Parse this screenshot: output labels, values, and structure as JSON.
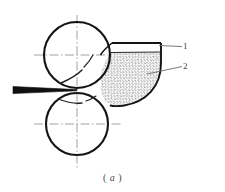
{
  "figure": {
    "caption": "( a )",
    "caption_prefix": "(",
    "caption_item": "a",
    "caption_suffix": ")",
    "labels": [
      {
        "id": "1",
        "text": "1",
        "refers_to": "hopper-wall"
      },
      {
        "id": "2",
        "text": "2",
        "refers_to": "powder-material"
      }
    ],
    "colors": {
      "line": "#1a1a1a",
      "centerline": "#808080",
      "stipple": "#555555",
      "leader": "#6b6b6b",
      "background": "#ffffff",
      "label": "#3a3a3a"
    },
    "geometry": {
      "upper_roll": {
        "cx": 77,
        "cy": 55,
        "r": 33
      },
      "lower_roll": {
        "cx": 77,
        "cy": 124,
        "r": 31
      },
      "contact_point": {
        "x": 77,
        "y": 90
      },
      "hopper_top_edge": {
        "x1": 112,
        "y1": 43,
        "x2": 161,
        "y2": 43
      },
      "fill_line": {
        "x1": 113,
        "y1": 52,
        "x2": 160,
        "y2": 52
      },
      "strip": {
        "x_start": 13,
        "x_end": 77,
        "y": 90
      }
    }
  }
}
